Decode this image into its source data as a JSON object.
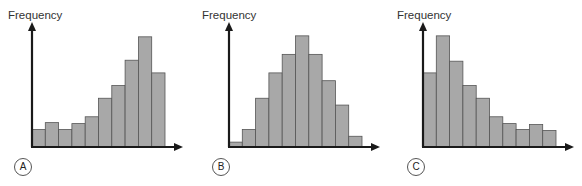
{
  "panels": [
    {
      "label": "A",
      "ylabel": "Frequency"
    },
    {
      "label": "B",
      "ylabel": "Frequency"
    },
    {
      "label": "C",
      "ylabel": "Frequency"
    }
  ],
  "chart_data": [
    {
      "type": "bar",
      "title": "A",
      "description": "Left-skewed (negatively skewed) histogram",
      "xlabel": "",
      "ylabel": "Frequency",
      "categories": [
        "1",
        "2",
        "3",
        "4",
        "5",
        "6",
        "7",
        "8",
        "9",
        "10"
      ],
      "values": [
        18,
        25,
        18,
        24,
        31,
        50,
        63,
        89,
        113,
        76
      ],
      "ylim": [
        0,
        120
      ],
      "grid": false
    },
    {
      "type": "bar",
      "title": "B",
      "description": "Symmetric (normal) histogram",
      "xlabel": "",
      "ylabel": "Frequency",
      "categories": [
        "1",
        "2",
        "3",
        "4",
        "5",
        "6",
        "7",
        "8",
        "9",
        "10"
      ],
      "values": [
        5,
        18,
        50,
        76,
        95,
        114,
        95,
        68,
        43,
        11
      ],
      "ylim": [
        0,
        120
      ],
      "grid": false
    },
    {
      "type": "bar",
      "title": "C",
      "description": "Right-skewed (positively skewed) histogram",
      "xlabel": "",
      "ylabel": "Frequency",
      "categories": [
        "1",
        "2",
        "3",
        "4",
        "5",
        "6",
        "7",
        "8",
        "9",
        "10"
      ],
      "values": [
        76,
        114,
        88,
        63,
        50,
        31,
        24,
        18,
        23,
        17
      ],
      "ylim": [
        0,
        120
      ],
      "grid": false
    }
  ],
  "style": {
    "bar_fill": "#a8a8a8",
    "bar_stroke": "#555555",
    "axis_color": "#1a1a1a"
  }
}
